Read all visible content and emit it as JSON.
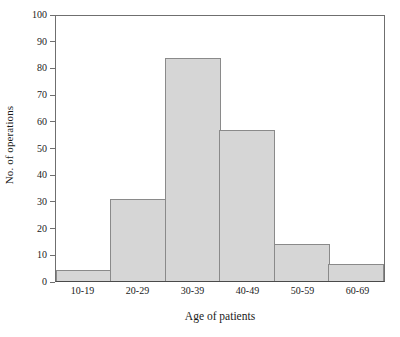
{
  "chart_data": {
    "type": "bar",
    "title": "",
    "subtitle": "",
    "xlabel": "Age of patients",
    "ylabel": "No. of operations",
    "categories": [
      "10-19",
      "20-29",
      "30-39",
      "40-49",
      "50-59",
      "60-69"
    ],
    "values": [
      4,
      31,
      84,
      57,
      14,
      6.5
    ],
    "series": [
      {
        "name": "No. of operations",
        "values": [
          4,
          31,
          84,
          57,
          14,
          6.5
        ]
      }
    ],
    "ylim": [
      0,
      100
    ],
    "yticks": [
      0,
      10,
      20,
      30,
      40,
      50,
      60,
      70,
      80,
      90,
      100
    ],
    "ytick_labels": [
      "0",
      "10",
      "20",
      "30",
      "40",
      "50",
      "60",
      "70",
      "80",
      "90",
      "100"
    ],
    "grid": false,
    "legend": false,
    "legend_position": "none",
    "bar_gap": 0,
    "colors": {
      "bar_fill": "#d6d6d6",
      "bar_border": "#8a8a8a",
      "axis": "#6f6f6f",
      "baseline": "#4a4a4a",
      "text": "#1a1a1a",
      "background": "#ffffff"
    }
  }
}
